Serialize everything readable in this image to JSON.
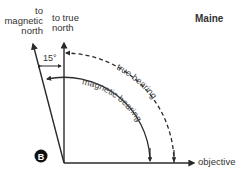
{
  "region": "Maine",
  "labels": {
    "magnetic_north": [
      "to",
      "magnetic",
      "north"
    ],
    "true_north": [
      "to true",
      "north"
    ],
    "angle": "15°",
    "true_bearing": "true bearing",
    "magnetic_bearing": "magnetic bearing",
    "objective": "objective",
    "point": "B"
  },
  "declination_deg": 15
}
